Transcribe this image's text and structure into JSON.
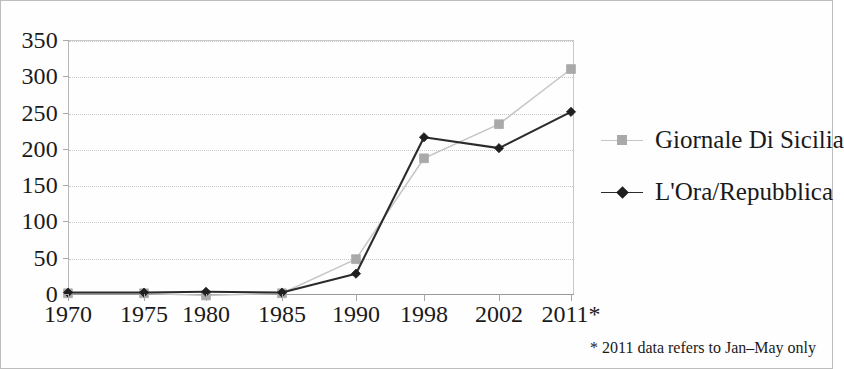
{
  "chart_data": {
    "type": "line",
    "title": "",
    "subtitle": "",
    "xlabel": "",
    "ylabel": "",
    "categories": [
      "1970",
      "1975",
      "1980",
      "1985",
      "1990",
      "1998",
      "2002",
      "2011*"
    ],
    "series": [
      {
        "name": "Giornale Di Sicilia",
        "color": "#c6c6c6",
        "marker": "square",
        "marker_color": "#a9a9a9",
        "values": [
          1,
          1,
          -2,
          1,
          48,
          187,
          234,
          310
        ]
      },
      {
        "name": "L'Ora/Repubblica",
        "color": "#2b2b2b",
        "marker": "diamond",
        "marker_color": "#1f1f1f",
        "values": [
          2,
          2,
          3,
          2,
          28,
          216,
          201,
          251
        ]
      }
    ],
    "ylim": [
      0,
      350
    ],
    "yticks": [
      0,
      50,
      100,
      150,
      200,
      250,
      300,
      350
    ],
    "ytick_labels": [
      "0",
      "50",
      "100",
      "150",
      "200",
      "250",
      "300",
      "350"
    ],
    "grid": true,
    "grid_axis": "y",
    "legend_position": "right",
    "annotations": [
      "* 2011 data refers to Jan–May only"
    ]
  },
  "legend": {
    "entries": [
      {
        "label": "Giornale Di Sicilia"
      },
      {
        "label": "L'Ora/Repubblica"
      }
    ]
  },
  "footnote": {
    "text": "* 2011 data refers to Jan–May only"
  }
}
